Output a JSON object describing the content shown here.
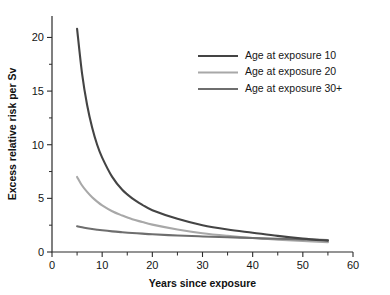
{
  "chart_data": {
    "type": "line",
    "title": "",
    "subtitle": "",
    "xlabel": "Years since exposure",
    "ylabel": "Excess relative risk per Sv",
    "xlim": [
      0,
      60
    ],
    "ylim": [
      0,
      22
    ],
    "grid": false,
    "legend_position": "upper-right",
    "x_ticks_major": [
      0,
      10,
      20,
      30,
      40,
      50,
      60
    ],
    "x_ticks_minor": [
      5,
      15,
      25,
      35,
      45,
      55
    ],
    "x_tick_labels": [
      "0",
      "10",
      "20",
      "30",
      "40",
      "50",
      "60"
    ],
    "y_ticks_major": [
      0,
      5,
      10,
      15,
      20
    ],
    "y_ticks_minor": [
      2.5,
      7.5,
      12.5,
      17.5
    ],
    "y_tick_labels": [
      "0",
      "5",
      "10",
      "15",
      "20"
    ],
    "x": [
      5,
      6,
      7,
      8,
      9,
      10,
      12,
      14,
      16,
      18,
      20,
      25,
      30,
      35,
      40,
      45,
      50,
      55
    ],
    "series": [
      {
        "name": "Age at exposure 10",
        "color": "#444444",
        "values": [
          20.8,
          16.6,
          13.7,
          11.6,
          10.0,
          8.8,
          7.0,
          5.8,
          5.0,
          4.4,
          3.9,
          3.1,
          2.5,
          2.1,
          1.8,
          1.5,
          1.25,
          1.05
        ]
      },
      {
        "name": "Age at exposure 20",
        "color": "#a8a8a8",
        "values": [
          7.0,
          6.2,
          5.6,
          5.1,
          4.7,
          4.35,
          3.8,
          3.4,
          3.05,
          2.8,
          2.55,
          2.1,
          1.75,
          1.5,
          1.3,
          1.15,
          1.02,
          0.92
        ]
      },
      {
        "name": "Age at exposure 30+",
        "color": "#6e6e6e",
        "values": [
          2.4,
          2.3,
          2.22,
          2.15,
          2.08,
          2.02,
          1.92,
          1.84,
          1.77,
          1.71,
          1.65,
          1.54,
          1.45,
          1.37,
          1.3,
          1.23,
          1.17,
          1.12
        ]
      }
    ],
    "legend_entries": [
      {
        "label": "Age at exposure 10",
        "color": "#444444"
      },
      {
        "label": "Age at exposure 20",
        "color": "#a8a8a8"
      },
      {
        "label": "Age at exposure 30+",
        "color": "#6e6e6e"
      }
    ]
  }
}
